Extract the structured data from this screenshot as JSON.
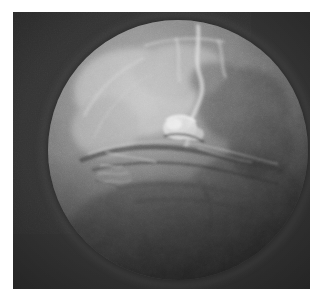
{
  "figure": {
    "kind": "astronomical-photograph",
    "caption": "",
    "alt_text": "Grayscale telescopic photograph of a planet showing a bright cratered and channeled hemisphere fading into shadow toward the lower right limb"
  },
  "canvas": {
    "width_px": 324,
    "height_px": 299,
    "page_background": "#ffffff",
    "margin_left_px": 13,
    "margin_top_px": 12,
    "margin_right_px": 14,
    "margin_bottom_px": 10
  },
  "plate": {
    "name": "image-plate",
    "x_px": 13,
    "y_px": 12,
    "width_px": 297,
    "height_px": 277,
    "sky_color_light": "#3a3a3a",
    "sky_color_dark": "#272727",
    "grain": "film-grain"
  },
  "disc": {
    "name": "planetary-disc",
    "center_x_px": 165,
    "center_y_px": 150,
    "radius_px": 130,
    "illuminated_from": "upper-left",
    "terminator": "lower-right",
    "highlight_tone": "#b9b9b9",
    "midtone": "#8a8a8a",
    "shadow_tone": "#3a3a3a",
    "limb_tone": "#2f2f2f"
  },
  "features": [
    {
      "name": "bright-northern-highlands",
      "type": "bright-albedo-region",
      "note": "broad light patch across the upper-left quadrant of the disc"
    },
    {
      "name": "bright-sinuous-channel",
      "type": "linear-bright-streak",
      "note": "vertical bright filament running down from the upper limb near the disc meridian"
    },
    {
      "name": "equatorial-canyon-system",
      "type": "dark-linear-rift",
      "note": "long horizontal fracture network crossing the middle of the disc"
    },
    {
      "name": "central-bright-massif",
      "type": "bright-knot",
      "note": "compact high-contrast cluster at the centre of the disc"
    },
    {
      "name": "dark-eastern-patch",
      "type": "dark-albedo-region",
      "note": "mottled dark area on the right side of the disc"
    },
    {
      "name": "southern-shadow-hemisphere",
      "type": "terminator-shadow",
      "note": "smooth darkening filling the lower third of the disc"
    }
  ],
  "labels": {
    "overlay_text": [],
    "scale_bar": null,
    "north_arrow": null
  }
}
